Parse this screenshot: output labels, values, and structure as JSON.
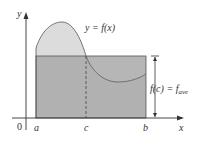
{
  "diagram": {
    "curve_label": "y = f(x)",
    "height_label_left": "f(c) = f",
    "height_label_sub": "ave",
    "axis_x_label": "x",
    "axis_y_label": "y",
    "origin_label": "0",
    "tick_labels": {
      "a": "a",
      "c": "c",
      "b": "b"
    },
    "colors": {
      "curve_fill": "#dcdcdc",
      "rect_fill": "#a9a9a9",
      "stroke": "#555555",
      "axis": "#333333"
    }
  }
}
